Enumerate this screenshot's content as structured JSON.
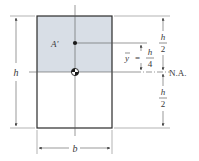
{
  "figure": {
    "type": "cross-section-diagram",
    "colors": {
      "shaded_area": "#d8dee6",
      "stroke": "#2b2b2b",
      "dim_line": "#555555",
      "background": "#ffffff"
    }
  },
  "labels": {
    "area": "A'",
    "height_left": "h",
    "half_top_num": "h",
    "half_top_den": "2",
    "half_bottom_num": "h",
    "half_bottom_den": "2",
    "ybar": "y",
    "equals": "=",
    "ybar_num": "h",
    "ybar_den": "4",
    "neutral_axis": "N.A.",
    "width": "b"
  }
}
